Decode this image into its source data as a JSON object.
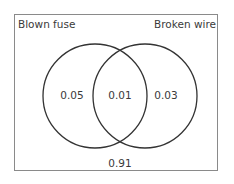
{
  "diagram": {
    "type": "venn",
    "sets": [
      {
        "name": "Blown fuse"
      },
      {
        "name": "Broken wire"
      }
    ],
    "regions": {
      "only_a": "0.05",
      "intersection": "0.01",
      "only_b": "0.03",
      "outside": "0.91"
    }
  }
}
